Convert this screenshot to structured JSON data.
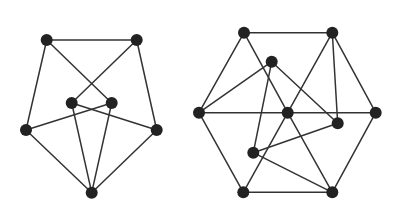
{
  "colors": {
    "edge": "#333333",
    "node": "#222222",
    "background": "#ffffff"
  },
  "graphs": [
    {
      "name": "pentagon-graph",
      "nodes": [
        {
          "id": "A",
          "x": 46.7,
          "y": 40
        },
        {
          "id": "B",
          "x": 136.7,
          "y": 40
        },
        {
          "id": "C",
          "x": 71.7,
          "y": 103
        },
        {
          "id": "D",
          "x": 111.7,
          "y": 103
        },
        {
          "id": "E",
          "x": 26,
          "y": 130
        },
        {
          "id": "F",
          "x": 156.7,
          "y": 130
        },
        {
          "id": "G",
          "x": 91.7,
          "y": 192.7
        }
      ],
      "edges": [
        [
          "A",
          "B"
        ],
        [
          "A",
          "E"
        ],
        [
          "A",
          "D"
        ],
        [
          "B",
          "C"
        ],
        [
          "B",
          "F"
        ],
        [
          "C",
          "F"
        ],
        [
          "D",
          "E"
        ],
        [
          "E",
          "G"
        ],
        [
          "F",
          "G"
        ],
        [
          "C",
          "G"
        ],
        [
          "D",
          "G"
        ]
      ]
    },
    {
      "name": "hexagon-graph",
      "nodes": [
        {
          "id": "P",
          "x": 244,
          "y": 32.7
        },
        {
          "id": "Q",
          "x": 332.3,
          "y": 32.7
        },
        {
          "id": "R",
          "x": 271.7,
          "y": 61.7
        },
        {
          "id": "S",
          "x": 199,
          "y": 112.7
        },
        {
          "id": "T",
          "x": 287.7,
          "y": 112.7
        },
        {
          "id": "U",
          "x": 375.7,
          "y": 112.7
        },
        {
          "id": "V",
          "x": 337.7,
          "y": 123.3
        },
        {
          "id": "W",
          "x": 253.3,
          "y": 152.7
        },
        {
          "id": "X",
          "x": 243.3,
          "y": 192.3
        },
        {
          "id": "Y",
          "x": 332.3,
          "y": 192.3
        }
      ],
      "edges": [
        [
          "P",
          "Q"
        ],
        [
          "P",
          "S"
        ],
        [
          "P",
          "T"
        ],
        [
          "Q",
          "T"
        ],
        [
          "Q",
          "V"
        ],
        [
          "Q",
          "U"
        ],
        [
          "R",
          "S"
        ],
        [
          "R",
          "V"
        ],
        [
          "R",
          "W"
        ],
        [
          "S",
          "T"
        ],
        [
          "T",
          "U"
        ],
        [
          "S",
          "X"
        ],
        [
          "T",
          "X"
        ],
        [
          "T",
          "Y"
        ],
        [
          "W",
          "V"
        ],
        [
          "W",
          "Y"
        ],
        [
          "X",
          "Y"
        ],
        [
          "U",
          "Y"
        ]
      ]
    }
  ]
}
